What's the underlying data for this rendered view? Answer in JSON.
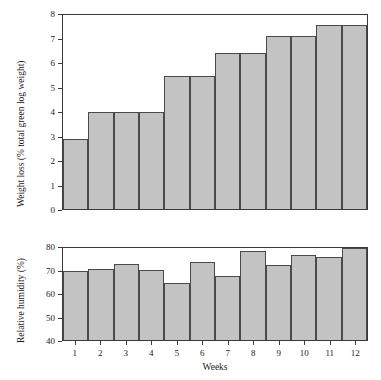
{
  "figure": {
    "background": "#ffffff",
    "bar_fill": "#c3c3c3",
    "bar_stroke": "#4a4a4a",
    "axis_color": "#3a3a3a"
  },
  "chart_data": [
    {
      "type": "bar",
      "id": "weight-loss",
      "title": "",
      "xlabel": "",
      "ylabel": "Weight loss (% total green log weight)",
      "categories": [
        "1",
        "2",
        "3",
        "4",
        "5",
        "6",
        "7",
        "8",
        "9",
        "10",
        "11",
        "12"
      ],
      "values": [
        2.9,
        4.0,
        4.0,
        4.0,
        5.5,
        5.5,
        6.45,
        6.45,
        7.15,
        7.15,
        7.6,
        7.6
      ],
      "ylim": [
        0,
        8
      ],
      "yticks": [
        0,
        1,
        2,
        3,
        4,
        5,
        6,
        7,
        8
      ],
      "ytick_labels": [
        "0",
        "1",
        "2",
        "3",
        "4",
        "5",
        "6",
        "7",
        "8"
      ],
      "grid": false,
      "legend": null
    },
    {
      "type": "bar",
      "id": "relative-humidity",
      "title": "",
      "xlabel": "Weeks",
      "ylabel": "Relative humidity (%)",
      "categories": [
        "1",
        "2",
        "3",
        "4",
        "5",
        "6",
        "7",
        "8",
        "9",
        "10",
        "11",
        "12"
      ],
      "values": [
        70.0,
        71.0,
        73.0,
        70.5,
        65.0,
        74.0,
        68.0,
        78.5,
        72.5,
        77.0,
        76.0,
        80.5
      ],
      "ylim": [
        40,
        80
      ],
      "yticks": [
        40,
        50,
        60,
        70,
        80
      ],
      "ytick_labels": [
        "40",
        "50",
        "60",
        "70",
        "80"
      ],
      "xtick_labels": [
        "1",
        "2",
        "3",
        "4",
        "5",
        "6",
        "7",
        "8",
        "9",
        "10",
        "11",
        "12"
      ],
      "grid": false,
      "legend": null
    }
  ]
}
